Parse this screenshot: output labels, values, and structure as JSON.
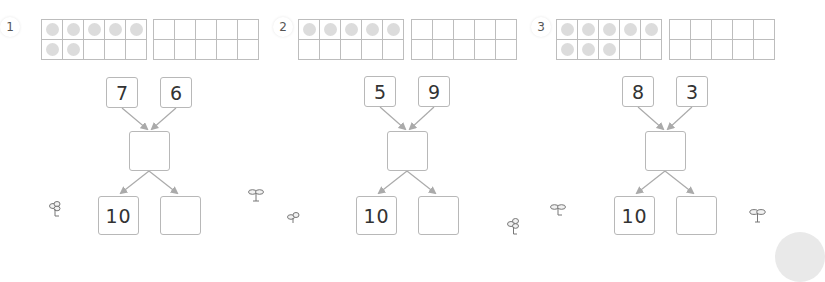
{
  "worksheet": {
    "colors": {
      "grid_line": "#bdbdbd",
      "dot": "#dcdcdc",
      "box_border": "#b8b8b8",
      "arrow": "#aaaaaa",
      "text": "#333333"
    },
    "problems": [
      {
        "label": "1",
        "ten_frame_1_dots": 7,
        "ten_frame_2_dots": 0,
        "addend_a": "7",
        "addend_b": "6",
        "sum_answer": "",
        "split_tens": "10",
        "split_ones_answer": ""
      },
      {
        "label": "2",
        "ten_frame_1_dots": 5,
        "ten_frame_2_dots": 0,
        "addend_a": "5",
        "addend_b": "9",
        "sum_answer": "",
        "split_tens": "10",
        "split_ones_answer": ""
      },
      {
        "label": "3",
        "ten_frame_1_dots": 8,
        "ten_frame_2_dots": 0,
        "addend_a": "8",
        "addend_b": "3",
        "sum_answer": "",
        "split_tens": "10",
        "split_ones_answer": ""
      }
    ],
    "decorations": {
      "icon": "sprout-icon",
      "count": 6
    }
  }
}
